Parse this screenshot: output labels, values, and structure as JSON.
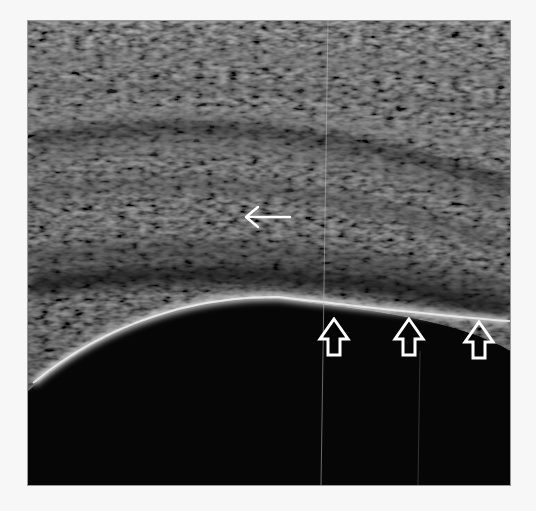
{
  "image": {
    "type": "ultrasound",
    "description": "Grayscale musculoskeletal ultrasound with a curved hyperechoic bone surface and layered soft tissue above",
    "background_color": "#f7f7f7",
    "frame_color": "#0a0a0a"
  },
  "annotations": [
    {
      "kind": "thin-arrow",
      "direction": "left",
      "x": 266,
      "y": 215,
      "color": "#ffffff"
    },
    {
      "kind": "hollow-arrow",
      "direction": "up",
      "x": 334,
      "y": 338,
      "color": "#ffffff"
    },
    {
      "kind": "hollow-arrow",
      "direction": "up",
      "x": 409,
      "y": 338,
      "color": "#ffffff"
    },
    {
      "kind": "hollow-arrow",
      "direction": "up",
      "x": 479,
      "y": 340,
      "color": "#ffffff"
    }
  ]
}
